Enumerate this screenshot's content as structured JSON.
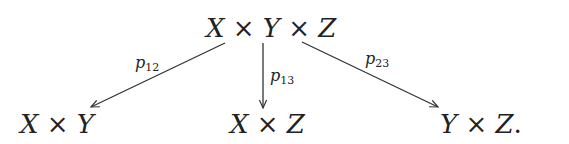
{
  "diagram": {
    "type": "commutative-diagram",
    "nodes": {
      "top": {
        "parts": [
          "X",
          " × ",
          "Y",
          " × ",
          "Z"
        ]
      },
      "left": {
        "parts": [
          "X",
          " × ",
          "Y"
        ]
      },
      "middle": {
        "parts": [
          "X",
          " × ",
          "Z"
        ]
      },
      "right": {
        "parts": [
          "Y",
          " × ",
          "Z",
          "."
        ]
      }
    },
    "arrows": [
      {
        "from": "top",
        "to": "left",
        "label": {
          "base": "p",
          "sub": "12"
        }
      },
      {
        "from": "top",
        "to": "middle",
        "label": {
          "base": "p",
          "sub": "13"
        }
      },
      {
        "from": "top",
        "to": "right",
        "label": {
          "base": "p",
          "sub": "23"
        }
      }
    ]
  }
}
